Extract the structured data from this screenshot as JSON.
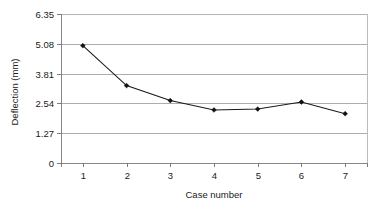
{
  "chart_data": {
    "type": "line",
    "title": "",
    "xlabel": "Case number",
    "ylabel": "Deflection (mm)",
    "x": [
      1,
      2,
      3,
      4,
      5,
      6,
      7
    ],
    "categories": [
      "1",
      "2",
      "3",
      "4",
      "5",
      "6",
      "7"
    ],
    "values": [
      5.0,
      3.3,
      2.66,
      2.26,
      2.3,
      2.6,
      2.1
    ],
    "series": [
      {
        "name": "Deflection",
        "values": [
          5.0,
          3.3,
          2.66,
          2.26,
          2.3,
          2.6,
          2.1
        ]
      }
    ],
    "xlim": [
      0.5,
      7.5
    ],
    "ylim": [
      0,
      6.35
    ],
    "ytick_labels": [
      "0",
      "1.27",
      "2.54",
      "3.81",
      "5.08",
      "6.35"
    ],
    "ytick_values": [
      0,
      1.27,
      2.54,
      3.81,
      5.08,
      6.35
    ],
    "xtick_labels": [
      "1",
      "2",
      "3",
      "4",
      "5",
      "6",
      "7"
    ],
    "grid": "horizontal",
    "legend": "none",
    "marker": "diamond",
    "line_color": "#1a1a1a",
    "grid_color": "#999999",
    "background_color": "#ffffff"
  },
  "axes": {
    "y_title": "Deflection (mm)",
    "x_title": "Case number",
    "y_ticks": [
      {
        "label": "6.35",
        "value": 6.35
      },
      {
        "label": "5.08",
        "value": 5.08
      },
      {
        "label": "3.81",
        "value": 3.81
      },
      {
        "label": "2.54",
        "value": 2.54
      },
      {
        "label": "1.27",
        "value": 1.27
      },
      {
        "label": "0",
        "value": 0
      }
    ],
    "x_ticks": [
      {
        "label": "1",
        "value": 1
      },
      {
        "label": "2",
        "value": 2
      },
      {
        "label": "3",
        "value": 3
      },
      {
        "label": "4",
        "value": 4
      },
      {
        "label": "5",
        "value": 5
      },
      {
        "label": "6",
        "value": 6
      },
      {
        "label": "7",
        "value": 7
      }
    ]
  }
}
